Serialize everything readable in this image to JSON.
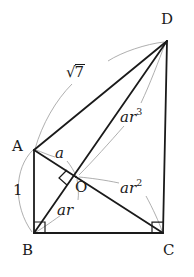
{
  "figure": {
    "kind": "geometry-diagram",
    "width": 194,
    "height": 277,
    "background_color": "#ffffff",
    "stroke_color": "#1a1a1a",
    "leader_color": "#8a8a8a"
  },
  "vertices": {
    "A": {
      "label": "A",
      "x": 34,
      "y": 150,
      "label_x": 12,
      "label_y": 141
    },
    "B": {
      "label": "B",
      "x": 34,
      "y": 233,
      "label_x": 22,
      "label_y": 245
    },
    "C": {
      "label": "C",
      "x": 163,
      "y": 233,
      "label_x": 162,
      "label_y": 245
    },
    "D": {
      "label": "D",
      "x": 167,
      "y": 41,
      "label_x": 162,
      "label_y": 14
    },
    "O": {
      "label": "O",
      "x": 76,
      "y": 177,
      "label_x": 76,
      "label_y": 181
    }
  },
  "measures": {
    "side_AB": {
      "text": "1",
      "x": 14,
      "y": 185
    },
    "seg_AO": {
      "text": "a",
      "x": 56,
      "y": 148
    },
    "seg_BO": {
      "base": "ar",
      "exponent": "",
      "x": 58,
      "y": 202
    },
    "seg_OC": {
      "base": "ar",
      "exponent": "2",
      "x": 122,
      "y": 181
    },
    "seg_OD": {
      "base": "ar",
      "exponent": "3",
      "x": 122,
      "y": 110
    },
    "diag_AD": {
      "text": "7",
      "radical": true,
      "x": 68,
      "y": 66
    }
  },
  "right_angles": [
    {
      "at": "B",
      "name": "right-angle-at-b"
    },
    {
      "at": "C",
      "name": "right-angle-at-c"
    },
    {
      "at": "O",
      "name": "right-angle-at-o"
    }
  ],
  "segments": [
    {
      "name": "segment-ab",
      "from": "A",
      "to": "B",
      "style": "solid"
    },
    {
      "name": "segment-bc",
      "from": "B",
      "to": "C",
      "style": "solid"
    },
    {
      "name": "segment-cd",
      "from": "C",
      "to": "D",
      "style": "solid"
    },
    {
      "name": "segment-ad",
      "from": "A",
      "to": "D",
      "style": "solid"
    },
    {
      "name": "segment-ao",
      "from": "A",
      "to": "O",
      "style": "solid"
    },
    {
      "name": "segment-bd",
      "from": "B",
      "to": "D",
      "style": "solid"
    },
    {
      "name": "segment-oc",
      "from": "O",
      "to": "C",
      "style": "solid"
    }
  ]
}
